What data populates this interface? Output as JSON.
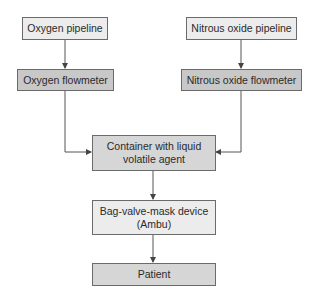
{
  "diagram": {
    "type": "flowchart",
    "nodes": [
      {
        "id": "oxygen_pipeline",
        "label": "Oxygen pipeline"
      },
      {
        "id": "oxygen_flowmeter",
        "label": "Oxygen flowmeter"
      },
      {
        "id": "nitrous_pipeline",
        "label": "Nitrous oxide pipeline"
      },
      {
        "id": "nitrous_flowmeter",
        "label": "Nitrous oxide flowmeter"
      },
      {
        "id": "container",
        "label": "Container with liquid volatile agent"
      },
      {
        "id": "bvm",
        "label": "Bag-valve-mask device (Ambu)"
      },
      {
        "id": "patient",
        "label": "Patient"
      }
    ],
    "edges": [
      {
        "from": "oxygen_pipeline",
        "to": "oxygen_flowmeter"
      },
      {
        "from": "nitrous_pipeline",
        "to": "nitrous_flowmeter"
      },
      {
        "from": "oxygen_flowmeter",
        "to": "container"
      },
      {
        "from": "nitrous_flowmeter",
        "to": "container"
      },
      {
        "from": "container",
        "to": "bvm"
      },
      {
        "from": "bvm",
        "to": "patient"
      }
    ],
    "labels": {
      "oxygen_pipeline": "Oxygen pipeline",
      "oxygen_flowmeter": "Oxygen flowmeter",
      "nitrous_pipeline": "Nitrous oxide pipeline",
      "nitrous_flowmeter": "Nitrous oxide flowmeter",
      "container_line1": "Container with liquid",
      "container_line2": "volatile agent",
      "bvm_line1": "Bag-valve-mask device",
      "bvm_line2": "(Ambu)",
      "patient": "Patient"
    },
    "colors": {
      "line": "#555555",
      "box_border": "#6b6b6b",
      "box_light": "#ececec",
      "box_dark": "#c8c8c8"
    }
  }
}
